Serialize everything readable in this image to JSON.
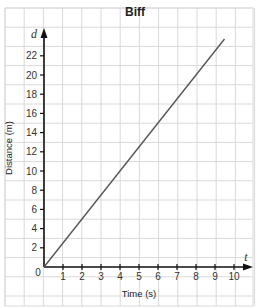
{
  "chart_data": {
    "type": "line",
    "title": "Biff",
    "xlabel": "Time (s)",
    "ylabel": "Distance (m)",
    "x_axis_variable": "t",
    "y_axis_variable": "d",
    "x_ticks": [
      1,
      2,
      3,
      4,
      5,
      6,
      7,
      8,
      9,
      10
    ],
    "y_ticks": [
      2,
      4,
      6,
      8,
      10,
      12,
      14,
      16,
      18,
      20,
      22
    ],
    "origin_label": "0",
    "xlim": [
      0,
      10.5
    ],
    "ylim": [
      0,
      24
    ],
    "grid": true,
    "series": [
      {
        "name": "Biff",
        "x": [
          0,
          9.5
        ],
        "y": [
          0,
          23.75
        ],
        "color": "#555555"
      }
    ]
  },
  "colors": {
    "grid": "#d9d9d9",
    "axis": "#111111",
    "line": "#555555"
  }
}
